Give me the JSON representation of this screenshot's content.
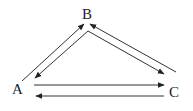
{
  "diagram": {
    "type": "directed-graph",
    "nodes": [
      {
        "id": "A",
        "label": "A"
      },
      {
        "id": "B",
        "label": "B"
      },
      {
        "id": "C",
        "label": "C"
      }
    ],
    "edges": [
      {
        "from": "A",
        "to": "B"
      },
      {
        "from": "B",
        "to": "A"
      },
      {
        "from": "B",
        "to": "C"
      },
      {
        "from": "C",
        "to": "B"
      },
      {
        "from": "A",
        "to": "C"
      },
      {
        "from": "C",
        "to": "A"
      }
    ],
    "colors": {
      "line": "#333333",
      "text": "#222222",
      "background": "#ffffff"
    }
  }
}
